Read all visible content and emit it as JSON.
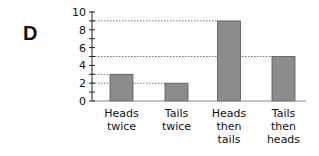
{
  "panel": {
    "letter": "D"
  },
  "chart_data": {
    "type": "bar",
    "title": "",
    "xlabel": "",
    "ylabel": "",
    "categories": [
      "Heads twice",
      "Tails twice",
      "Heads then tails",
      "Tails then heads"
    ],
    "category_lines": [
      [
        "Heads",
        "twice"
      ],
      [
        "Tails",
        "twice"
      ],
      [
        "Heads",
        "then",
        "tails"
      ],
      [
        "Tails",
        "then",
        "heads"
      ]
    ],
    "values": [
      3,
      2,
      9,
      5
    ],
    "ylim": [
      0,
      10
    ],
    "yticks": [
      0,
      2,
      4,
      6,
      8,
      10
    ],
    "minor_tick_step": 1,
    "grid": false,
    "reference_lines": "dotted lines from y-axis to top of each bar",
    "bar_color": "#8c8c8c",
    "bar_edge_color": "#555555"
  }
}
